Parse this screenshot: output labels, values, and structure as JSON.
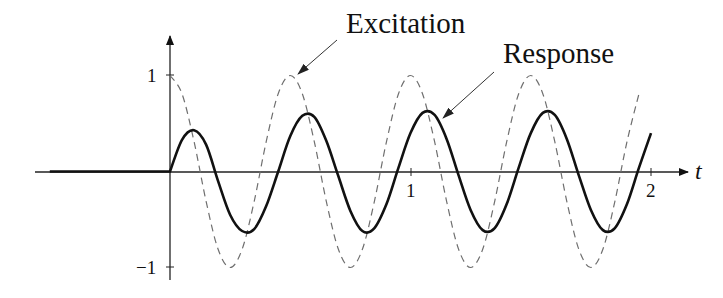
{
  "chart_data": {
    "type": "line",
    "title": "",
    "xlabel": "t",
    "ylabel": "",
    "xlim": [
      -0.56,
      2.1
    ],
    "ylim": [
      -1,
      1
    ],
    "x_ticks": [
      {
        "value": 1,
        "label": "1"
      },
      {
        "value": 2,
        "label": "2"
      }
    ],
    "y_ticks": [
      {
        "value": 1,
        "label": "1"
      },
      {
        "value": -1,
        "label": "−1"
      }
    ],
    "grid": false,
    "legend": "none (annotated with arrows)",
    "annotations": [
      {
        "text": "Excitation",
        "points_to": {
          "t": 0.53,
          "y": 1.0
        }
      },
      {
        "text": "Response",
        "points_to": {
          "t": 1.13,
          "y": 0.57
        }
      }
    ],
    "series": [
      {
        "name": "Excitation",
        "style": "dashed",
        "color": "#777777",
        "x": [
          0,
          0.05,
          0.1,
          0.15,
          0.2,
          0.25,
          0.3,
          0.35,
          0.4,
          0.45,
          0.5,
          0.55,
          0.6,
          0.65,
          0.7,
          0.75,
          0.8,
          0.85,
          0.9,
          0.95,
          1.0,
          1.05,
          1.1,
          1.15,
          1.2,
          1.25,
          1.3,
          1.35,
          1.4,
          1.45,
          1.5,
          1.55,
          1.6,
          1.65,
          1.7,
          1.75,
          1.8,
          1.85,
          1.9,
          1.95
        ],
        "values": [
          1,
          0.81,
          0.31,
          -0.31,
          -0.81,
          -1,
          -0.81,
          -0.31,
          0.31,
          0.81,
          1,
          0.81,
          0.31,
          -0.31,
          -0.81,
          -1,
          -0.81,
          -0.31,
          0.31,
          0.81,
          1,
          0.81,
          0.31,
          -0.31,
          -0.81,
          -1,
          -0.81,
          -0.31,
          0.31,
          0.81,
          1,
          0.81,
          0.31,
          -0.31,
          -0.81,
          -1,
          -0.81,
          -0.31,
          0.31,
          0.81
        ]
      },
      {
        "name": "Response",
        "style": "solid-thick",
        "color": "#111111",
        "x": [
          -0.5,
          0,
          0.05,
          0.1,
          0.15,
          0.2,
          0.25,
          0.3,
          0.35,
          0.4,
          0.45,
          0.5,
          0.55,
          0.6,
          0.65,
          0.7,
          0.75,
          0.8,
          0.85,
          0.9,
          0.95,
          1.0,
          1.05,
          1.1,
          1.15,
          1.2,
          1.25,
          1.3,
          1.35,
          1.4,
          1.45,
          1.5,
          1.55,
          1.6,
          1.65,
          1.7,
          1.75,
          1.8,
          1.85,
          1.9,
          1.95,
          2.0
        ],
        "values": [
          0,
          0,
          0.33,
          0.43,
          0.28,
          -0.1,
          -0.45,
          -0.62,
          -0.6,
          -0.36,
          0.0,
          0.37,
          0.58,
          0.57,
          0.32,
          -0.05,
          -0.41,
          -0.62,
          -0.59,
          -0.34,
          0.04,
          0.4,
          0.61,
          0.59,
          0.34,
          -0.04,
          -0.4,
          -0.61,
          -0.59,
          -0.34,
          0.04,
          0.4,
          0.61,
          0.59,
          0.34,
          -0.04,
          -0.4,
          -0.61,
          -0.59,
          -0.34,
          0.04,
          0.4
        ]
      }
    ]
  },
  "labels": {
    "excitation": "Excitation",
    "response": "Response",
    "x_axis": "t",
    "tick_x_1": "1",
    "tick_x_2": "2",
    "tick_y_1": "1",
    "tick_y_neg1": "−1"
  }
}
